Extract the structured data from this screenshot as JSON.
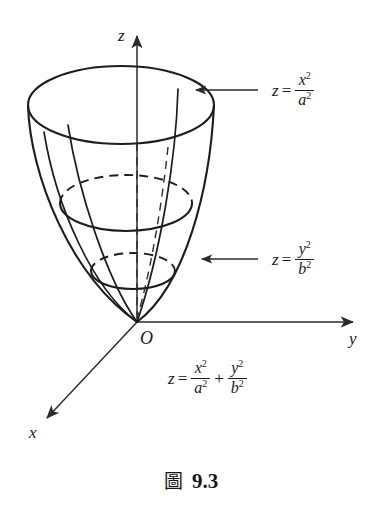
{
  "figure": {
    "kind": "elliptic-paraboloid-3d-sketch",
    "background_color": "#ffffff",
    "ink_color": "#1a1a1a"
  },
  "axes": {
    "z_label": "z",
    "y_label": "y",
    "x_label": "x",
    "origin_label": "O"
  },
  "annotations": {
    "trace_xz": {
      "lhs": "z",
      "equals": "=",
      "numerator": "x",
      "numerator_exponent": "2",
      "denominator": "a",
      "denominator_exponent": "2"
    },
    "trace_yz": {
      "lhs": "z",
      "equals": "=",
      "numerator": "y",
      "numerator_exponent": "2",
      "denominator": "b",
      "denominator_exponent": "2"
    },
    "surface_equation": {
      "lhs": "z",
      "equals": "=",
      "term1_num": "x",
      "term1_num_exp": "2",
      "term1_den": "a",
      "term1_den_exp": "2",
      "plus": "+",
      "term2_num": "y",
      "term2_num_exp": "2",
      "term2_den": "b",
      "term2_den_exp": "2"
    }
  },
  "caption": {
    "mark": "圖",
    "number": "9.3"
  }
}
